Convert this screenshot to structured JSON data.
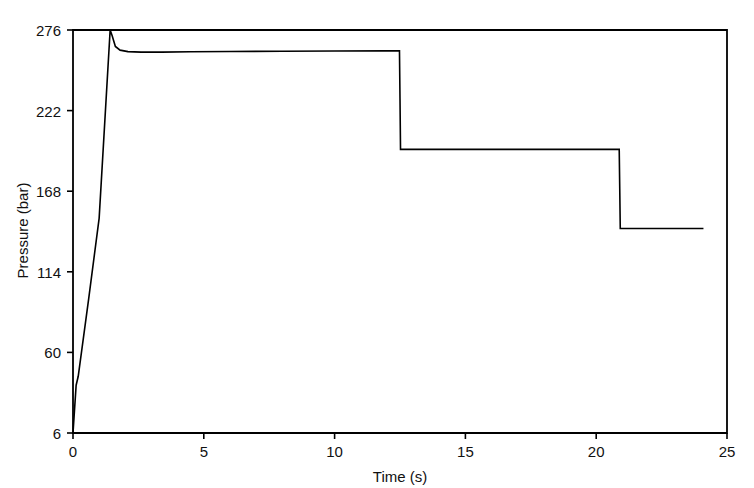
{
  "chart_data": {
    "type": "line",
    "title": "",
    "xlabel": "Time (s)",
    "ylabel": "Pressure (bar)",
    "xlim": [
      0,
      25
    ],
    "ylim": [
      6,
      276
    ],
    "xticks": [
      0,
      5,
      10,
      15,
      20,
      25
    ],
    "xtick_labels": [
      "0",
      "5",
      "10",
      "15",
      "20",
      "25"
    ],
    "yticks": [
      6,
      60,
      114,
      168,
      222,
      276
    ],
    "ytick_labels": [
      "6",
      "60",
      "114",
      "168",
      "222",
      "276"
    ],
    "grid": false,
    "legend": null,
    "line_color": "#000000",
    "line_width": 1.6,
    "series": [
      {
        "name": "Pressure",
        "x": [
          0.0,
          0.12,
          0.2,
          0.6,
          1.0,
          1.42,
          1.5,
          1.62,
          1.8,
          2.1,
          2.6,
          3.4,
          4.5,
          6.0,
          8.0,
          10.0,
          12.0,
          12.48,
          12.5,
          12.52,
          14.0,
          16.0,
          18.0,
          20.0,
          20.88,
          20.9,
          20.92,
          21.6,
          22.5,
          23.4,
          24.1
        ],
        "y": [
          6.0,
          38.0,
          44.0,
          96.0,
          150.0,
          276.0,
          272.0,
          265.0,
          262.5,
          261.5,
          261.2,
          261.2,
          261.4,
          261.6,
          261.8,
          261.9,
          262.0,
          262.0,
          230.0,
          196.0,
          196.0,
          196.0,
          196.0,
          196.0,
          196.0,
          170.0,
          143.0,
          143.0,
          143.0,
          143.0,
          143.0
        ]
      }
    ],
    "annotations": {
      "peak_pressure": 276,
      "peak_time": 1.45,
      "plateau_1": 262,
      "step_1_time": 12.5,
      "plateau_2": 196,
      "step_2_time": 20.9,
      "plateau_3": 143,
      "data_end_time": 24.1
    }
  },
  "axes": {
    "frame_color": "#000000",
    "frame_left_px": 73,
    "frame_right_px": 727,
    "frame_top_px": 30,
    "frame_bottom_px": 433
  }
}
